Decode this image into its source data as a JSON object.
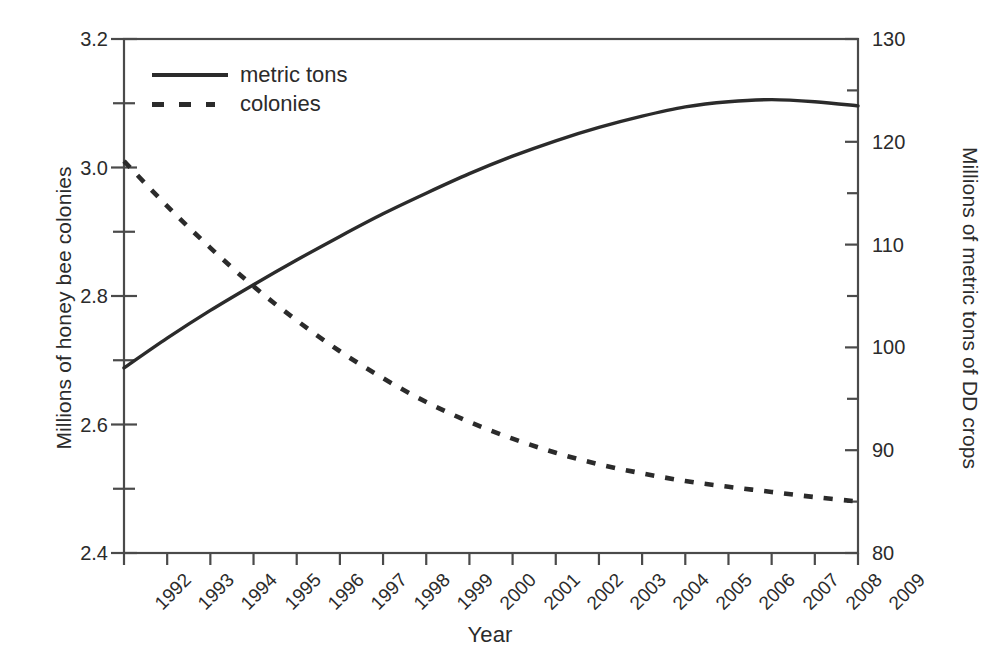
{
  "chart_data": {
    "type": "line",
    "title": "",
    "subtitle": "",
    "xlabel": "Year",
    "ylabel": "Millions of honey bee colonies",
    "ylabel_right": "Millions of metric tons of DD crops",
    "grid": false,
    "legend_position": "top-left",
    "x": [
      1992,
      1993,
      1994,
      1995,
      1996,
      1997,
      1998,
      1999,
      2000,
      2001,
      2002,
      2003,
      2004,
      2005,
      2006,
      2007,
      2008,
      2009
    ],
    "xtick_labels": [
      "1992",
      "1993",
      "1994",
      "1995",
      "1996",
      "1997",
      "1998",
      "1999",
      "2000",
      "2001",
      "2002",
      "2003",
      "2004",
      "2005",
      "2006",
      "2007",
      "2008",
      "2009"
    ],
    "xtick_rotation": -45,
    "xlim": [
      1992,
      2009
    ],
    "ylim": [
      2.4,
      3.2
    ],
    "ytick_labels": [
      "2.4",
      "2.6",
      "2.8",
      "3.0",
      "3.2"
    ],
    "yticks": [
      2.4,
      2.6,
      2.8,
      3.0,
      3.2
    ],
    "yminor_step": 0.1,
    "ylim_right": [
      80,
      130
    ],
    "ytick_labels_right": [
      "80",
      "90",
      "100",
      "110",
      "120",
      "130"
    ],
    "yticks_right": [
      80,
      90,
      100,
      110,
      120,
      130
    ],
    "yminor_step_right": 5,
    "line_color": "#2b2b2b",
    "frame_color": "#4a4a4a",
    "series": [
      {
        "name": "metric tons",
        "axis": "right",
        "style": "solid",
        "values": [
          98.0,
          100.9,
          103.6,
          106.1,
          108.5,
          110.8,
          113.0,
          115.0,
          116.9,
          118.6,
          120.1,
          121.4,
          122.5,
          123.4,
          123.9,
          124.1,
          123.9,
          123.5
        ]
      },
      {
        "name": "colonies",
        "axis": "left",
        "style": "dashed",
        "values": [
          3.01,
          2.94,
          2.875,
          2.815,
          2.762,
          2.714,
          2.672,
          2.635,
          2.604,
          2.578,
          2.556,
          2.538,
          2.524,
          2.512,
          2.503,
          2.495,
          2.487,
          2.48
        ]
      }
    ],
    "legend": [
      {
        "label": "metric tons",
        "style": "solid"
      },
      {
        "label": "colonies",
        "style": "dashed"
      }
    ]
  }
}
